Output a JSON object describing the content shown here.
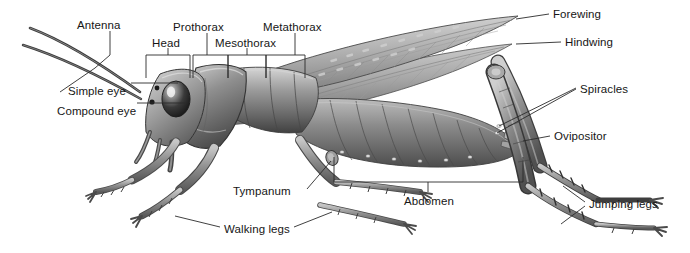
{
  "figure": {
    "title": "",
    "background_color": "#ffffff",
    "line_color": "#2b2b2b",
    "text_color": "#161616",
    "art_tones": {
      "highlight": "#e4e4e4",
      "light": "#b9b9b9",
      "mid": "#8d8d8d",
      "dark": "#5f5f5f",
      "shadow": "#3b3b3b",
      "outline": "#2e2e2e"
    }
  },
  "labels": [
    {
      "id": "antenna",
      "text": "Antenna",
      "x": 77,
      "y": 20,
      "align": "left"
    },
    {
      "id": "head",
      "text": "Head",
      "x": 152,
      "y": 38,
      "align": "left"
    },
    {
      "id": "prothorax",
      "text": "Prothorax",
      "x": 173,
      "y": 22,
      "align": "left"
    },
    {
      "id": "mesothorax",
      "text": "Mesothorax",
      "x": 215,
      "y": 38,
      "align": "left"
    },
    {
      "id": "metathorax",
      "text": "Metathorax",
      "x": 263,
      "y": 22,
      "align": "left"
    },
    {
      "id": "simple-eye",
      "text": "Simple eye",
      "x": 68,
      "y": 86,
      "align": "left"
    },
    {
      "id": "compound-eye",
      "text": "Compound eye",
      "x": 57,
      "y": 106,
      "align": "left"
    },
    {
      "id": "forewing",
      "text": "Forewing",
      "x": 553,
      "y": 9,
      "align": "left"
    },
    {
      "id": "hindwing",
      "text": "Hindwing",
      "x": 565,
      "y": 37,
      "align": "left"
    },
    {
      "id": "spiracles",
      "text": "Spiracles",
      "x": 580,
      "y": 84,
      "align": "left"
    },
    {
      "id": "ovipositor",
      "text": "Ovipositor",
      "x": 554,
      "y": 131,
      "align": "left"
    },
    {
      "id": "jumping-legs",
      "text": "Jumping legs",
      "x": 589,
      "y": 199,
      "align": "left"
    },
    {
      "id": "abdomen",
      "text": "Abdomen",
      "x": 404,
      "y": 196,
      "align": "left"
    },
    {
      "id": "tympanum",
      "text": "Tympanum",
      "x": 233,
      "y": 186,
      "align": "left"
    },
    {
      "id": "walking-legs",
      "text": "Walking legs",
      "x": 224,
      "y": 224,
      "align": "left"
    }
  ],
  "brackets": [
    {
      "id": "head-bracket",
      "x1": 146,
      "x2": 190,
      "top": 55,
      "bottom": 78,
      "stem_x": 168,
      "stem_top": 48
    },
    {
      "id": "prothorax-bracket",
      "x1": 193,
      "x2": 228,
      "top": 55,
      "bottom": 78,
      "stem_x": 207,
      "stem_top": 33
    },
    {
      "id": "mesothorax-bracket",
      "x1": 228,
      "x2": 266,
      "top": 55,
      "bottom": 78,
      "stem_x": 247,
      "stem_top": 48
    },
    {
      "id": "metathorax-bracket",
      "x1": 266,
      "x2": 305,
      "top": 55,
      "bottom": 78,
      "stem_x": 295,
      "stem_top": 33
    },
    {
      "id": "abdomen-bracket",
      "x1": 334,
      "x2": 523,
      "top": 157,
      "bottom": 182,
      "stem_x": 428,
      "stem_bottom": 192
    }
  ],
  "leaders": [
    {
      "id": "antenna-leader",
      "points": "110,31 110,55 95,68 60,92"
    },
    {
      "id": "simple-eye-leader",
      "points": "131,83 178,83"
    },
    {
      "id": "compound-eye-leader",
      "points": "137,103 186,103"
    },
    {
      "id": "forewing-leader",
      "points": "549,14 516,19"
    },
    {
      "id": "hindwing-leader",
      "points": "561,42 516,44"
    },
    {
      "id": "spiracles-leader-1",
      "points": "576,88 499,126"
    },
    {
      "id": "spiracles-leader-2",
      "points": "576,89 497,133"
    },
    {
      "id": "ovipositor-leader",
      "points": "550,136 523,141"
    },
    {
      "id": "jumping-legs-leader-1",
      "points": "585,202 563,186"
    },
    {
      "id": "jumping-legs-leader-2",
      "points": "585,206 561,224"
    },
    {
      "id": "tympanum-leader",
      "points": "307,189 331,161"
    },
    {
      "id": "walking-legs-leader-1",
      "points": "220,227 175,216"
    },
    {
      "id": "walking-legs-leader-2",
      "points": "294,227 332,212"
    }
  ]
}
